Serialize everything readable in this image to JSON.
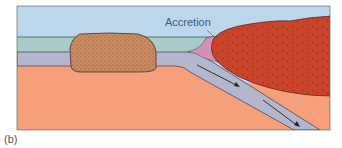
{
  "figure": {
    "panel_label": "(b)",
    "annotation": "Accretion",
    "layers": [
      {
        "name": "atmosphere",
        "color": "#bcd6ec"
      },
      {
        "name": "ocean",
        "color": "#a8cbc8"
      },
      {
        "name": "oceanic-crust",
        "color": "#b4b6cc"
      },
      {
        "name": "mantle",
        "color": "#f5a07a"
      },
      {
        "name": "terrane-block",
        "color": "#c98a62"
      },
      {
        "name": "continent",
        "color": "#c8452c"
      },
      {
        "name": "accretion-wedge",
        "color": "#d690b4"
      }
    ],
    "arrows": [
      "subduction-arrow-upper",
      "subduction-arrow-lower"
    ]
  }
}
